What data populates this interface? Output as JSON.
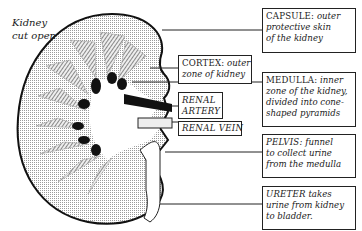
{
  "diagram": {
    "title": [
      "Kidney",
      "cut open"
    ],
    "labels": [
      {
        "id": "capsule",
        "head": "CAPSULE:",
        "lines": [
          "outer",
          "protective skin",
          "of the kidney"
        ]
      },
      {
        "id": "cortex",
        "head": "CORTEX:",
        "lines": [
          "outer",
          "zone of kidney"
        ]
      },
      {
        "id": "medulla",
        "head": "MEDULLA:",
        "lines": [
          "inner",
          "zone of the kidney,",
          "divided into cone-",
          "shaped pyramids"
        ]
      },
      {
        "id": "renal-artery",
        "head": "RENAL",
        "lines": [
          "ARTERY"
        ]
      },
      {
        "id": "renal-vein",
        "head": "RENAL VEIN",
        "lines": []
      },
      {
        "id": "pelvis",
        "head": "PELVIS:",
        "lines": [
          "funnel",
          "to collect urine",
          "from the medulla"
        ]
      },
      {
        "id": "ureter",
        "head": "URETER",
        "lines": [
          "takes",
          "urine from kidney",
          "to bladder."
        ]
      }
    ],
    "colors": {
      "ink": "#1a1a1a",
      "stipple": "#c8c8c8",
      "background": "#ffffff"
    }
  }
}
